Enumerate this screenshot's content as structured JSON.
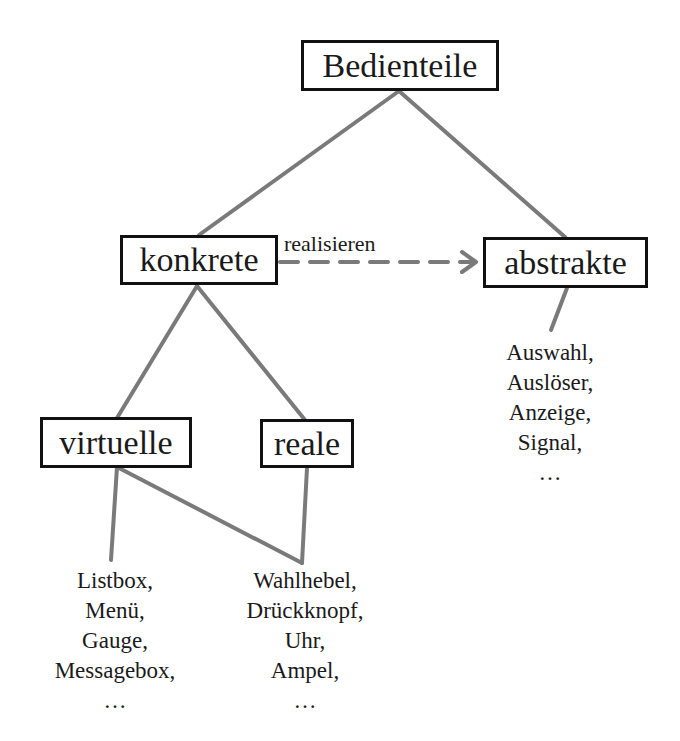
{
  "diagram": {
    "root": {
      "label": "Bedienteile"
    },
    "nodes": {
      "konkrete": {
        "label": "konkrete"
      },
      "abstrakte": {
        "label": "abstrakte"
      },
      "virtuelle": {
        "label": "virtuelle"
      },
      "reale": {
        "label": "reale"
      }
    },
    "relation": {
      "label": "realisieren",
      "from": "konkrete",
      "to": "abstrakte",
      "style": "dashed-arrow"
    },
    "lists": {
      "abstrakte": [
        "Auswahl,",
        "Auslöser,",
        "Anzeige,",
        "Signal,",
        "…"
      ],
      "virtuelle": [
        "Listbox,",
        "Menü,",
        "Gauge,",
        "Messagebox,",
        "…"
      ],
      "reale": [
        "Wahlhebel,",
        "Drückknopf,",
        "Uhr,",
        "Ampel,",
        "…"
      ]
    },
    "colors": {
      "line": "#7a7a7a",
      "box_border": "#111111",
      "text": "#1a1a1a",
      "background": "#ffffff"
    }
  }
}
